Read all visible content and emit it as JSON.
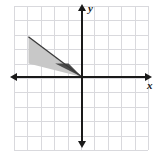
{
  "figure": {
    "type": "coordinate-plane-diagram",
    "title": "",
    "background_color": "#ffffff"
  },
  "axes": {
    "x_label": "x",
    "y_label": "y",
    "axis_color": "#1a1a1a",
    "origin_px": {
      "x": 82,
      "y": 77
    },
    "cell_size_px": 13.4,
    "x_range": [
      -5,
      5
    ],
    "y_range": [
      -5,
      5
    ],
    "tick_labels_shown": false,
    "arrowheads": [
      "left",
      "right",
      "up",
      "down"
    ]
  },
  "grid": {
    "visible": true,
    "color": "#d9d9dd",
    "columns": 10,
    "rows": 10,
    "left_px": 14,
    "top_px": 6,
    "width_px": 134,
    "height_px": 144
  },
  "shapes": [
    {
      "name": "light-gray-triangle",
      "fill": "#c8c8c8",
      "vertices_grid": [
        [
          -4,
          3
        ],
        [
          -4,
          1
        ],
        [
          0,
          0
        ]
      ],
      "vertices_px": [
        [
          28.5,
          36.8
        ],
        [
          28.5,
          63.6
        ],
        [
          82,
          77
        ]
      ]
    },
    {
      "name": "dark-gray-triangle",
      "fill": "#4a4a4a",
      "vertices_grid": [
        [
          -2,
          1
        ],
        [
          -1,
          1
        ],
        [
          0,
          0
        ]
      ],
      "vertices_px": [
        [
          55.2,
          63.6
        ],
        [
          68.6,
          63.6
        ],
        [
          82,
          77
        ]
      ]
    }
  ],
  "strokes": [
    {
      "name": "hypotenuse-line",
      "color": "#3a3a3a",
      "from_grid": [
        -4,
        3
      ],
      "to_grid": [
        0,
        0
      ]
    }
  ],
  "colors": {
    "light_gray": "#c8c8c8",
    "dark_gray": "#4a4a4a",
    "grid_line": "#d9d9dd",
    "axis": "#1a1a1a"
  }
}
